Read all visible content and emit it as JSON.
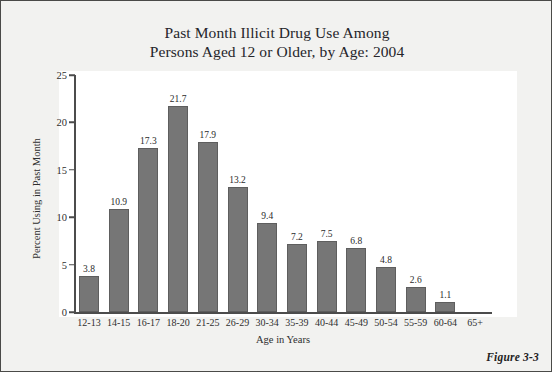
{
  "figure": {
    "caption": "Figure 3-3"
  },
  "chart_data": {
    "type": "bar",
    "title": "Past Month Illicit Drug Use Among Persons Aged 12 or Older, by Age: 2004",
    "title_lines": [
      "Past Month Illicit Drug Use Among",
      "Persons Aged 12 or Older, by Age: 2004"
    ],
    "xlabel": "Age in Years",
    "ylabel": "Percent Using in Past Month",
    "categories": [
      "12-13",
      "14-15",
      "16-17",
      "18-20",
      "21-25",
      "26-29",
      "30-34",
      "35-39",
      "40-44",
      "45-49",
      "50-54",
      "55-59",
      "60-64",
      "65+"
    ],
    "values": [
      3.8,
      10.9,
      17.3,
      21.7,
      17.9,
      13.2,
      9.4,
      7.2,
      7.5,
      6.8,
      4.8,
      2.6,
      1.1,
      0.0
    ],
    "value_labels": [
      "3.8",
      "10.9",
      "17.3",
      "21.7",
      "17.9",
      "13.2",
      "9.4",
      "7.2",
      "7.5",
      "6.8",
      "4.8",
      "2.6",
      "1.1",
      ""
    ],
    "ylim": [
      0,
      25
    ],
    "yticks": [
      0,
      5,
      10,
      15,
      20,
      25
    ],
    "ytick_labels": [
      "0",
      "5",
      "10",
      "15",
      "20",
      "25"
    ],
    "grid": false,
    "legend": false,
    "bar_color": "#767676",
    "bar_edge_color": "#5e5e5e",
    "axis_color": "#4c4c4c",
    "plot_background": "#ffffff",
    "figure_background": "#f2f2f0"
  }
}
